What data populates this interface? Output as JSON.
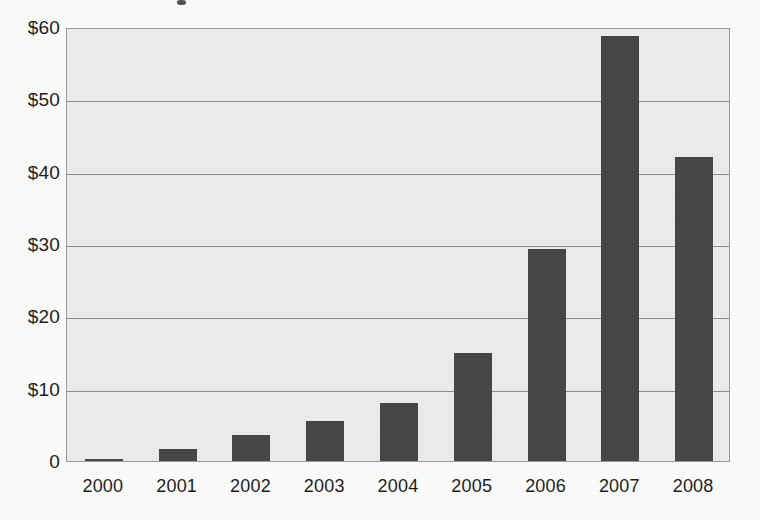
{
  "chart_data": {
    "type": "bar",
    "title": "",
    "xlabel": "",
    "ylabel": "",
    "categories": [
      "2000",
      "2001",
      "2002",
      "2003",
      "2004",
      "2005",
      "2006",
      "2007",
      "2008"
    ],
    "values": [
      0.3,
      1.7,
      3.6,
      5.5,
      8.0,
      15.0,
      29.3,
      58.7,
      42.0
    ],
    "ylim": [
      0,
      60
    ],
    "ytick_values": [
      60,
      50,
      40,
      30,
      20,
      10,
      0
    ],
    "ytick_labels": [
      "$60",
      "$50",
      "$40",
      "$30",
      "$20",
      "$10",
      "0"
    ],
    "grid": true,
    "legend": "none",
    "series": [
      {
        "name": "",
        "values": [
          0.3,
          1.7,
          3.6,
          5.5,
          8.0,
          15.0,
          29.3,
          58.7,
          42.0
        ]
      }
    ],
    "colors": {
      "bar": "#474747",
      "plot_background": "#ededed",
      "gridline": "#8d8d8d",
      "axis_text": "#1d1d1d",
      "page_background": "#fdfdfd"
    }
  }
}
